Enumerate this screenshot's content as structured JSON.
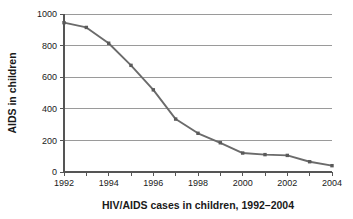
{
  "chart_data": {
    "type": "line",
    "title": "",
    "xlabel": "HIV/AIDS cases in children, 1992–2004",
    "ylabel": "AIDS in children",
    "categories": [
      1992,
      1993,
      1994,
      1995,
      1996,
      1997,
      1998,
      1999,
      2000,
      2001,
      2002,
      2003,
      2004
    ],
    "values": [
      945,
      915,
      815,
      675,
      520,
      335,
      245,
      185,
      120,
      110,
      105,
      65,
      40
    ],
    "series": [
      {
        "name": "AIDS in children",
        "values": [
          945,
          915,
          815,
          675,
          520,
          335,
          245,
          185,
          120,
          110,
          105,
          65,
          40
        ]
      }
    ],
    "xlim": [
      1992,
      2004
    ],
    "ylim": [
      0,
      1000
    ],
    "yticks": [
      0,
      200,
      400,
      600,
      800,
      1000
    ],
    "ytick_labels": [
      "0",
      "200",
      "400",
      "600",
      "800",
      "1000"
    ],
    "xticks": [
      1992,
      1993,
      1994,
      1995,
      1996,
      1997,
      1998,
      1999,
      2000,
      2001,
      2002,
      2003,
      2004
    ],
    "xtick_labels_shown": [
      "1992",
      "1994",
      "1996",
      "1998",
      "2000",
      "2002",
      "2004"
    ],
    "grid": "horizontal",
    "legend": "none",
    "line_color": "#6b6b6b",
    "marker_color": "#5a5a5a",
    "grid_color": "#9a9a9a",
    "axis_color": "#555555",
    "background": "#ffffff"
  }
}
